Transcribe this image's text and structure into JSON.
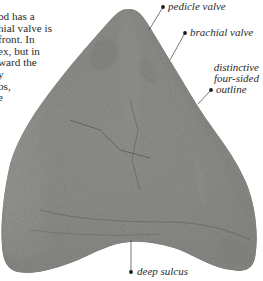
{
  "paragraph": {
    "lines": [
      "od has a",
      "hial valve is",
      " front. In",
      "ex, but in",
      "ward the",
      "y",
      "bs,",
      "e"
    ]
  },
  "specimen": {
    "name": "brachiopod fossil",
    "annotations": [
      {
        "id": "pedicle-valve",
        "text": "pedicle valve"
      },
      {
        "id": "brachial-valve",
        "text": "brachial valve"
      },
      {
        "id": "outline",
        "lines": [
          "distinctive",
          "four-sided",
          "outline"
        ]
      },
      {
        "id": "deep-sulcus",
        "text": "deep sulcus"
      }
    ]
  },
  "colors": {
    "text": "#2b2b2b",
    "leader": "#3a3a3a",
    "rock_light": "#c9c9c6",
    "rock_mid": "#8d8d8a",
    "rock_dark": "#4a4a48"
  }
}
